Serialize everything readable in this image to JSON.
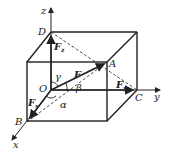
{
  "diagram": {
    "type": "3d-force-decomposition",
    "axes": {
      "x": "x",
      "y": "y",
      "z": "z"
    },
    "points": {
      "origin": "O",
      "A": "A",
      "B": "B",
      "C": "C",
      "D": "D"
    },
    "vectors": {
      "F": "F",
      "Fx": {
        "base": "F",
        "sub": "x"
      },
      "Fy": {
        "base": "F",
        "sub": "y"
      },
      "Fz": {
        "base": "F",
        "sub": "z"
      }
    },
    "angles": {
      "alpha": "α",
      "beta": "β",
      "gamma": "γ"
    },
    "colors": {
      "line": "#222222",
      "background": "#ffffff"
    }
  }
}
